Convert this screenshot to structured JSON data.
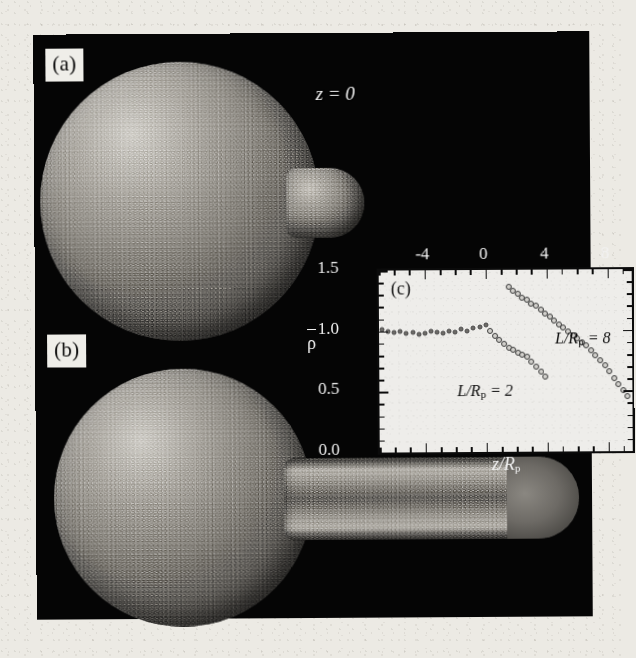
{
  "figure": {
    "panels": [
      {
        "tag": "(a)",
        "description": "spherical particle cluster with short neck"
      },
      {
        "tag": "(b)",
        "description": "spherical particle cluster with long cylindrical tail"
      }
    ],
    "annotations": {
      "z_zero": "z = 0"
    }
  },
  "chart_data": {
    "type": "scatter",
    "title": "(c)",
    "xlabel": "z/Rp",
    "ylabel": "ρ̄",
    "xlabel_parts": {
      "num": "z",
      "slash": "/",
      "den": "R",
      "sub": "p"
    },
    "xlim": [
      -7,
      9.6
    ],
    "ylim": [
      0.0,
      1.5
    ],
    "xticks": [
      -4,
      0,
      4,
      8
    ],
    "xticklabels": [
      "-4",
      "0",
      "4",
      "8"
    ],
    "yticks": [
      0.0,
      0.5,
      1.0,
      1.5
    ],
    "yticklabels": [
      "0.0",
      "0.5",
      "1.0",
      "1.5"
    ],
    "xtick_position": "top",
    "grid": false,
    "legend": "inline-annotations",
    "series": [
      {
        "name": "L/Rp = 2",
        "label_parts": {
          "num": "L",
          "slash": "/",
          "den": "R",
          "sub": "p",
          "eq": " = ",
          "val": "2"
        },
        "x": [
          -6.8,
          -6.4,
          -6.0,
          -5.6,
          -5.2,
          -4.8,
          -4.4,
          -4.0,
          -3.6,
          -3.2,
          -2.8,
          -2.4,
          -2.0,
          -1.6,
          -1.2,
          -0.8,
          -0.4,
          0.0,
          0.3,
          0.6,
          0.9,
          1.2,
          1.5,
          1.8,
          2.1,
          2.4,
          2.7,
          3.0,
          3.3,
          3.6,
          3.9
        ],
        "y": [
          1.01,
          1.0,
          0.99,
          1.0,
          0.98,
          0.99,
          0.97,
          0.98,
          1.0,
          0.99,
          0.98,
          1.0,
          0.99,
          1.01,
          1.0,
          1.02,
          1.03,
          1.05,
          1.0,
          0.96,
          0.92,
          0.89,
          0.86,
          0.84,
          0.82,
          0.8,
          0.78,
          0.74,
          0.7,
          0.66,
          0.62
        ]
      },
      {
        "name": "L/Rp = 8",
        "label_parts": {
          "num": "L",
          "slash": "/",
          "den": "R",
          "sub": "p",
          "eq": " = ",
          "val": "8"
        },
        "x": [
          1.5,
          1.8,
          2.1,
          2.4,
          2.7,
          3.0,
          3.3,
          3.6,
          3.9,
          4.2,
          4.5,
          4.8,
          5.1,
          5.4,
          5.7,
          6.0,
          6.3,
          6.6,
          6.9,
          7.2,
          7.5,
          7.8,
          8.1,
          8.4,
          8.7,
          9.0,
          9.3
        ],
        "y": [
          1.36,
          1.33,
          1.3,
          1.27,
          1.25,
          1.22,
          1.2,
          1.17,
          1.14,
          1.11,
          1.08,
          1.05,
          1.02,
          0.99,
          0.96,
          0.93,
          0.9,
          0.87,
          0.83,
          0.79,
          0.75,
          0.71,
          0.66,
          0.6,
          0.55,
          0.5,
          0.45
        ]
      }
    ]
  }
}
